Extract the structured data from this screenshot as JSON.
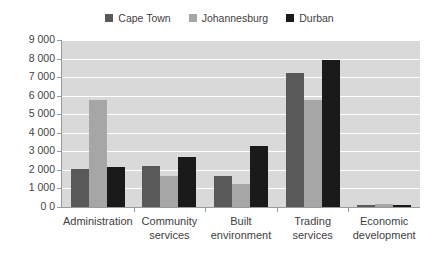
{
  "chart_data": {
    "type": "bar",
    "title": "",
    "xlabel": "",
    "ylabel": "",
    "categories": [
      "Administration",
      "Community services",
      "Built environment",
      "Trading services",
      "Economic development"
    ],
    "category_lines": [
      [
        "Administration"
      ],
      [
        "Community",
        "services"
      ],
      [
        "Built",
        "environment"
      ],
      [
        "Trading",
        "services"
      ],
      [
        "Economic",
        "development"
      ]
    ],
    "series": [
      {
        "name": "Cape Town",
        "color": "#595959",
        "values": [
          2050,
          2200,
          1670,
          7230,
          120
        ]
      },
      {
        "name": "Johannesburg",
        "color": "#a6a6a6",
        "values": [
          5780,
          1680,
          1220,
          5760,
          180
        ]
      },
      {
        "name": "Durban",
        "color": "#1a1a1a",
        "values": [
          2150,
          2680,
          3270,
          7900,
          110
        ]
      }
    ],
    "ylim": [
      0,
      9000
    ],
    "ytick_step": 1000,
    "ytick_labels": [
      "9 000",
      "8 000",
      "7 000",
      "6 000",
      "5 000",
      "4 000",
      "3 000",
      "2 000",
      "1 000",
      "0 0"
    ],
    "grid": true,
    "legend_position": "top-center",
    "plot_background": "#d9d9d9",
    "gridline_color": "#ffffff",
    "axis_color": "#9a9a9a",
    "text_color": "#3f3f3f"
  }
}
